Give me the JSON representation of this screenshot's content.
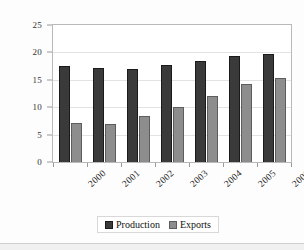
{
  "chart_data": {
    "type": "bar",
    "title": "",
    "xlabel": "",
    "ylabel": "Million m",
    "ylabel_superscript": "3",
    "categories": [
      "2000",
      "2001",
      "2002",
      "2003",
      "2004",
      "2005",
      "2006"
    ],
    "series": [
      {
        "name": "Production",
        "color": "#3a3a3a",
        "values": [
          17.5,
          17.2,
          16.9,
          17.7,
          18.5,
          19.3,
          19.7
        ]
      },
      {
        "name": "Exports",
        "color": "#8d8d8d",
        "values": [
          7.2,
          7.0,
          8.4,
          10.1,
          12.0,
          14.2,
          15.4
        ]
      }
    ],
    "ylim": [
      0,
      25
    ],
    "ytick_values": [
      "25",
      "20",
      "15",
      "10",
      "5",
      "0"
    ],
    "grid": true,
    "legend_position": "bottom-center"
  },
  "legend": {
    "entries": [
      {
        "label": "Production"
      },
      {
        "label": "Exports"
      }
    ]
  }
}
